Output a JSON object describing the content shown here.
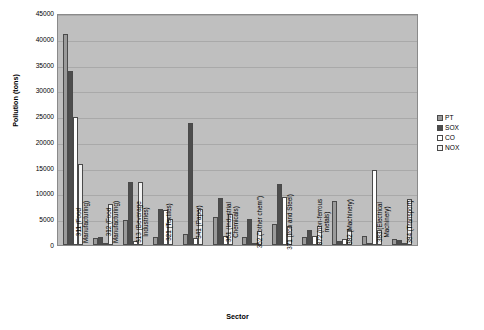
{
  "chart_data": {
    "type": "bar",
    "title": "",
    "xlabel": "Sector",
    "ylabel": "Pollution (tons)",
    "ylim": [
      0,
      45000
    ],
    "ytick_step": 5000,
    "yticks": [
      0,
      5000,
      10000,
      15000,
      20000,
      25000,
      30000,
      35000,
      40000,
      45000
    ],
    "grid": true,
    "legend_position": "right",
    "plot_background": "#bfbfbf",
    "categories": [
      "311 (Food Manufacturing)",
      "312 (Food Manufacturing)",
      "313 (Beverage Industries)",
      "321 (Textiles)",
      "341 (Paper)",
      "351 (Industrial Chemicals)",
      "352 (\"other chem\")",
      "371 (Iron and Steel)",
      "372 (non-ferrous metals)",
      "382 (Machinery)",
      "383 (Electrical Machinery)",
      "384 (Transport)"
    ],
    "series": [
      {
        "name": "PT",
        "color": "#9a9a9a",
        "values": [
          41000,
          1300,
          4800,
          1600,
          2200,
          5400,
          1500,
          4000,
          1500,
          8500,
          1800,
          1200
        ]
      },
      {
        "name": "SOX",
        "color": "#4d4d4d",
        "values": [
          33700,
          1500,
          12300,
          7000,
          23700,
          9200,
          5000,
          11900,
          3000,
          700,
          200,
          1000
        ]
      },
      {
        "name": "CO",
        "color": "#ffffff",
        "values": [
          24900,
          400,
          700,
          6700,
          1400,
          1800,
          300,
          9400,
          1800,
          1200,
          14600,
          300
        ]
      },
      {
        "name": "NOX",
        "color": "#f2f2f2",
        "values": [
          15800,
          8000,
          12200,
          5000,
          7000,
          6000,
          2800,
          3700,
          3700,
          3000,
          3000,
          9000
        ]
      }
    ]
  }
}
